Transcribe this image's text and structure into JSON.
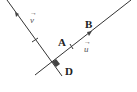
{
  "diagram": {
    "points": {
      "A": "A",
      "B": "B",
      "D": "D"
    },
    "vectors": {
      "u": "u",
      "v": "v"
    },
    "vector_arrow": "→",
    "colors": {
      "line": "#333333",
      "marker": "#444444",
      "text": "#222222"
    }
  }
}
